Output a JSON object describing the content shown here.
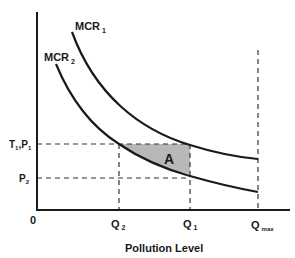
{
  "diagram": {
    "type": "economics-marginal-cost-of-reduction",
    "x_axis": {
      "label": "Pollution Level",
      "origin_label": "0"
    },
    "curves": [
      {
        "name": "MCR",
        "subscript": "1"
      },
      {
        "name": "MCR",
        "subscript": "2"
      }
    ],
    "y_ticks": [
      {
        "label": "T",
        "sub1": "1",
        "mid": ",P",
        "sub2": "1"
      },
      {
        "label": "P",
        "sub": "2"
      }
    ],
    "x_ticks": [
      {
        "label": "Q",
        "sub": "2"
      },
      {
        "label": "Q",
        "sub": "1"
      },
      {
        "label": "Q",
        "sub": "max"
      }
    ],
    "area_label": "A",
    "colors": {
      "line": "#1a1a1a",
      "shaded": "#b8b8b8",
      "dashed": "#333333"
    }
  }
}
